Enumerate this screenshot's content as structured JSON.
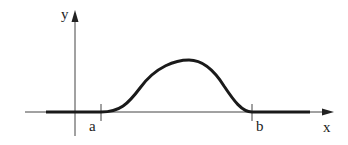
{
  "diagram": {
    "type": "function-plot",
    "labels": {
      "y_axis": "y",
      "x_axis": "x",
      "left_bound": "a",
      "right_bound": "b"
    },
    "colors": {
      "axis": "#444444",
      "curve": "#1a1a1a",
      "background": "#ffffff"
    }
  }
}
